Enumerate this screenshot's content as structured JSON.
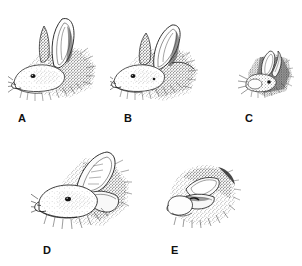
{
  "figure": {
    "kind": "scientific-illustration-plate",
    "background_color": "#ffffff",
    "ink_color": "#1a1a1a",
    "panel_count": 5
  },
  "panels": [
    {
      "id": "a",
      "label": "A",
      "caption": "",
      "posture": "both ears fully erect and upright",
      "view": "left profile, head low to ground",
      "relative_size": "large",
      "bbox": {
        "x": 8,
        "y": 10,
        "w": 96,
        "h": 98
      },
      "label_pos": {
        "x": 18,
        "y": 112
      }
    },
    {
      "id": "b",
      "label": "B",
      "caption": "",
      "posture": "ears tilted back, one ear rotating rearward",
      "view": "left profile, head low to ground",
      "relative_size": "large",
      "bbox": {
        "x": 110,
        "y": 15,
        "w": 92,
        "h": 90
      },
      "label_pos": {
        "x": 124,
        "y": 112
      }
    },
    {
      "id": "c",
      "label": "C",
      "caption": "",
      "posture": "ears angled back and partly folded",
      "view": "left profile, reduced scale",
      "relative_size": "small",
      "bbox": {
        "x": 238,
        "y": 45,
        "w": 58,
        "h": 58
      },
      "label_pos": {
        "x": 245,
        "y": 112
      }
    },
    {
      "id": "d",
      "label": "D",
      "caption": "",
      "posture": "ears laid back flat along the neck",
      "view": "left profile, head low to ground",
      "relative_size": "large",
      "bbox": {
        "x": 31,
        "y": 140,
        "w": 106,
        "h": 98
      },
      "label_pos": {
        "x": 43,
        "y": 244
      }
    },
    {
      "id": "e",
      "label": "E",
      "caption": "",
      "posture": "ears completely flattened against the head",
      "view": "oblique front-left, crouched",
      "relative_size": "medium",
      "bbox": {
        "x": 160,
        "y": 155,
        "w": 82,
        "h": 82
      },
      "label_pos": {
        "x": 171,
        "y": 244
      }
    }
  ]
}
